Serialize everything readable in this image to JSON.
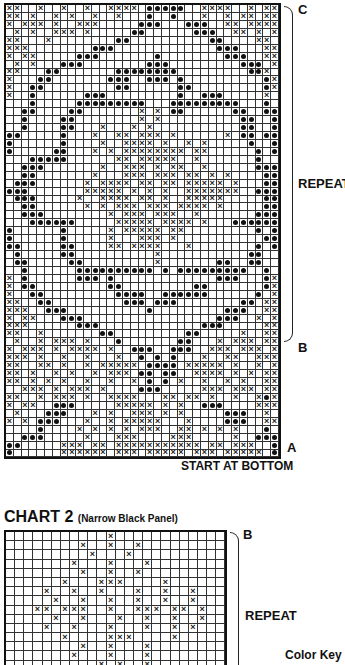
{
  "chart1": {
    "label_top": "C",
    "label_repeat": "REPEAT",
    "label_b": "B",
    "label_a": "A",
    "start_note": "START AT BOTTOM",
    "cols": 35,
    "rows": [
      "xx..x..x..x..xxxx.ooooo..xxxx..x.xx",
      "xx.x..x.x..x..x...o..o...x..x.xx.xx",
      "x.xxx.x..xxx.....ooo...ooo..xx.xxxx",
      ".x.x..xxx.x.....oo......ooo..xx.x.x",
      "xx...x........oo..........oo....xx.",
      "xxx........ooo.............ooo...xx",
      "x.xx.....ooo.......o........ooo..xx",
      ".x.x...ooo........ooo.........ooo.x",
      "xx...oo.......oooooooo.........oox.",
      "x...oo.......ooo..ooo.o..........ox",
      "x..oo.........oo......oo.........ox",
      "x..o......ooo.........o..ooo.....x.",
      "...o.....ooooooooo...ooooooooo...o.",
      "..oo....oo.......x.x.oo......oo..oo",
      "..o....oo........x.x..........oo..o",
      "..o....oo...x...x.x...........oo..o",
      "oo.....o...x..xx.xxx.x......x.oo.oo",
      "o......o....x..xxxx.x..x.x.....o..o",
      "o.....oo...x.x.xxxxxxxx.xx......o.o",
      "...ooooo......xx.xxxxx..x.......o..",
      "..ooo.......x..xxx.x.xx..x......ooo",
      "..oo.......x...xxx.xxx.xx.x.x....oo",
      ".ooo......x.xxxx.xx.xx.xxxxx.x...oo",
      "ooo.......xxxxx.x.x.x..xxxxxxx..ooo",
      ".ooo.....x..xxxx.xx.x..xxxxx.....oo",
      "..oo......x.x.xxx.xxx.xxxx.x.....oo",
      "..ooo........x.xxx.xxx..x.......ooo",
      "...oooooo.....xxxxx.xxxx.x...oooooo",
      "o......o.....x.xxxxx.xx.........o.o",
      "o......o.....x...xxx.x...........oo",
      "oo.....oo....xx.xxxx...x........o.o",
      ".o.....oo..........x...........oo..",
      ".oo.....oo.........x.......oo..oo..",
      "..o......oooooooooo.o.ooooooooo..o.",
      "x.o......ooo.o.............ooo...ox",
      "x.oo.........oo.........oo.......ox",
      "x..oo.........oooo..oooooo......o.x",
      "xx..oo.........ooo.ooo........oo.xx",
      "xxx..ooo..........o.........ooo..xx",
      "x.xx...ooo.................ooo..x.x",
      "xxx......ooo.............ooo.....xx",
      "xx..x.......oo.........oo.....x..xx",
      ".x..x.xxx.x...o.......oo...x.xxx.xx",
      "x.xxx.x.xxxx.x..ooo..ooo..xxx.xxx.x",
      "xxx.x..x..x...x..o.o.o...x..xx..xxx",
      "xx..xx.x..x.xxxxx.oooo.xxxxx.x..x.x",
      "xx.x..x.x..x.xxx.oo.oo..xxxx.x.x.xx",
      "xx.x.x.x..x..x..x.o.o.x..x..x.x..xx",
      "..xxx.x.xxx.x....ooo.....xxx.xxx.xx",
      "xx..x.xxx.x..xxxx...xx.xx.x..x..xox",
      "x.xx..ooo.....xxxxx.x.x..ooo....xxx",
      ".x...ooo...x.x..xxx.x.x.....ooo..x.",
      "x.x.ooo...x..x.xxxxx...x....ooo..xx",
      "....o....x.x.x.x.xxx..xx.x.x.x...o.",
      "..ooo.....x...xxx....xxx.....x..ooo",
      "oo.....xxx.xx.xxxxxxxxxxx.xx.xxx..o",
      "o......xxxxxx.xxx.xxxxx.xxx.xxxxx.o"
    ]
  },
  "chart2": {
    "title": "CHART 2",
    "subtitle": "(Narrow Black Panel)",
    "label_b": "B",
    "label_repeat": "REPEAT",
    "color_key": "Color Key",
    "cols": 24,
    "rows": [
      "...........x............",
      "........x..x..x.........",
      ".........x...x..........",
      ".......x...x...x........",
      "........x..x..x.........",
      "......x...xxx....x......",
      "....x..x..x...x..x..x...",
      ".....x..x..x..x..x..x...",
      "...xx.xxx..x..xxx.xx.x..",
      ".....x..x...x..x..x..x..",
      "....x..x...x...x..x.x...",
      "......x....xxx....x.....",
      "........x..x...x........",
      ".......x...x...x........",
      "..........x.x..x........"
    ]
  }
}
